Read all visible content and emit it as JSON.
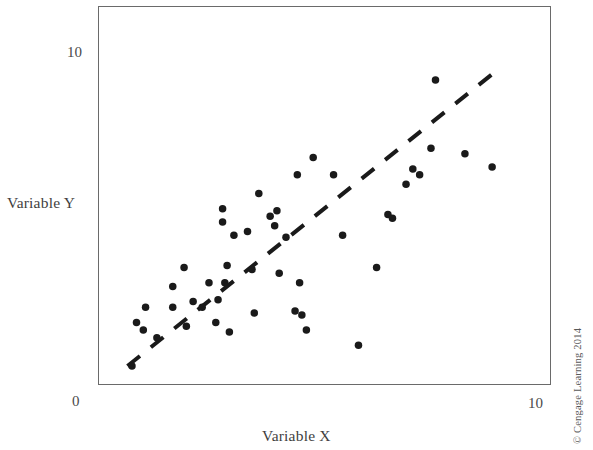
{
  "figure": {
    "credit": "© Cengage Learning 2014"
  },
  "chart_data": {
    "type": "scatter",
    "title": "",
    "subtitle": "",
    "xlabel": "Variable X",
    "ylabel": "Variable Y",
    "xlim": [
      0,
      10
    ],
    "ylim": [
      0,
      10
    ],
    "xticks": [
      0,
      10
    ],
    "yticks": [
      0,
      10
    ],
    "xtick_labels": [
      "",
      "10"
    ],
    "ytick_labels": [
      "0",
      "10"
    ],
    "grid": false,
    "legend": false,
    "marker_color": "#1a1a1a",
    "marker_size_px": 7.5,
    "frame_color": "#6a6a6a",
    "trendline": {
      "style": "dashed",
      "color": "#1a1a1a",
      "width_px": 4,
      "x": [
        0.65,
        8.7
      ],
      "y": [
        0.5,
        8.2
      ]
    },
    "points": [
      {
        "x": 0.75,
        "y": 0.5
      },
      {
        "x": 0.85,
        "y": 1.65
      },
      {
        "x": 1.0,
        "y": 1.45
      },
      {
        "x": 1.05,
        "y": 2.05
      },
      {
        "x": 1.3,
        "y": 1.25
      },
      {
        "x": 1.65,
        "y": 2.05
      },
      {
        "x": 1.65,
        "y": 2.6
      },
      {
        "x": 1.9,
        "y": 3.1
      },
      {
        "x": 1.95,
        "y": 1.55
      },
      {
        "x": 2.1,
        "y": 2.2
      },
      {
        "x": 2.3,
        "y": 2.05
      },
      {
        "x": 2.45,
        "y": 2.7
      },
      {
        "x": 2.6,
        "y": 1.65
      },
      {
        "x": 2.65,
        "y": 2.25
      },
      {
        "x": 2.75,
        "y": 4.65
      },
      {
        "x": 2.75,
        "y": 4.3
      },
      {
        "x": 2.8,
        "y": 2.7
      },
      {
        "x": 2.85,
        "y": 3.15
      },
      {
        "x": 2.9,
        "y": 1.4
      },
      {
        "x": 3.0,
        "y": 3.95
      },
      {
        "x": 3.3,
        "y": 4.05
      },
      {
        "x": 3.4,
        "y": 3.05
      },
      {
        "x": 3.45,
        "y": 1.9
      },
      {
        "x": 3.55,
        "y": 5.05
      },
      {
        "x": 3.8,
        "y": 4.45
      },
      {
        "x": 3.9,
        "y": 4.2
      },
      {
        "x": 3.95,
        "y": 4.6
      },
      {
        "x": 4.0,
        "y": 2.95
      },
      {
        "x": 4.15,
        "y": 3.9
      },
      {
        "x": 4.35,
        "y": 1.95
      },
      {
        "x": 4.4,
        "y": 5.55
      },
      {
        "x": 4.45,
        "y": 2.7
      },
      {
        "x": 4.5,
        "y": 1.85
      },
      {
        "x": 4.6,
        "y": 1.45
      },
      {
        "x": 4.75,
        "y": 6.0
      },
      {
        "x": 5.2,
        "y": 5.55
      },
      {
        "x": 5.4,
        "y": 3.95
      },
      {
        "x": 5.75,
        "y": 1.05
      },
      {
        "x": 6.15,
        "y": 3.1
      },
      {
        "x": 6.4,
        "y": 4.5
      },
      {
        "x": 6.5,
        "y": 4.4
      },
      {
        "x": 6.8,
        "y": 5.3
      },
      {
        "x": 6.95,
        "y": 5.7
      },
      {
        "x": 7.1,
        "y": 5.55
      },
      {
        "x": 7.35,
        "y": 6.25
      },
      {
        "x": 7.45,
        "y": 8.05
      },
      {
        "x": 8.1,
        "y": 6.1
      },
      {
        "x": 8.7,
        "y": 5.75
      }
    ]
  }
}
